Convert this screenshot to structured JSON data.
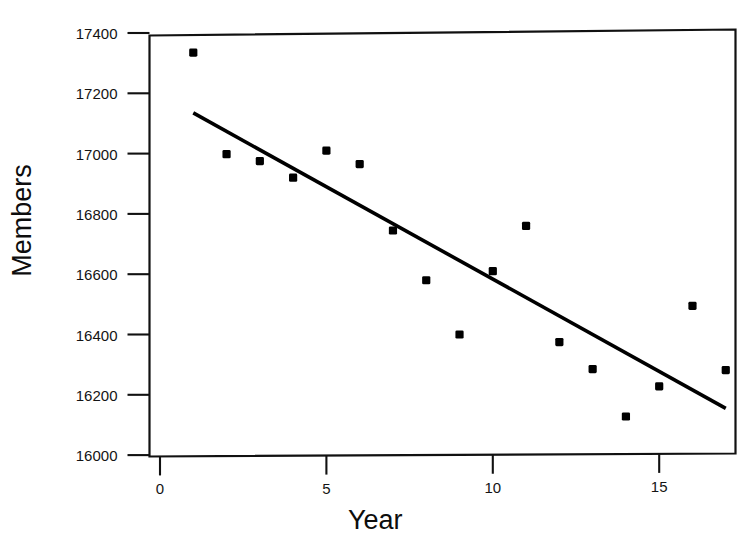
{
  "chart_data": {
    "type": "scatter",
    "title": "",
    "xlabel": "Year",
    "ylabel": "Members",
    "xlim": [
      -0.3,
      17.3
    ],
    "ylim": [
      16000,
      17400
    ],
    "grid": false,
    "legend": "none",
    "x_ticks": [
      0,
      5,
      10,
      15
    ],
    "x_tick_labels": [
      "0",
      "5",
      "10",
      "15"
    ],
    "y_ticks": [
      16000,
      16200,
      16400,
      16600,
      16800,
      17000,
      17200,
      17400
    ],
    "y_tick_labels": [
      "16000",
      "16200",
      "16400",
      "16600",
      "16800",
      "17000",
      "17200",
      "17400"
    ],
    "marker": "filled-square",
    "marker_color": "#000000",
    "series": [
      {
        "name": "Members",
        "x": [
          1,
          2,
          3,
          4,
          5,
          6,
          7,
          8,
          9,
          10,
          11,
          12,
          13,
          14,
          15,
          16,
          17
        ],
        "values": [
          17335,
          16998,
          16975,
          16920,
          17010,
          16965,
          16745,
          16580,
          16400,
          16610,
          16760,
          16375,
          16285,
          16128,
          16228,
          16495,
          16282
        ]
      }
    ],
    "trend_line": {
      "name": "fitted regression line",
      "color": "#000000",
      "x_start": 1.0,
      "y_start": 17135,
      "x_end": 17.0,
      "y_end": 16155,
      "slope": -61.25,
      "intercept": 17196.25
    },
    "axis_color": "#111111",
    "background": "#ffffff"
  },
  "axes": {
    "x_title": "Year",
    "y_title": "Members"
  },
  "header": {
    "title": ""
  }
}
